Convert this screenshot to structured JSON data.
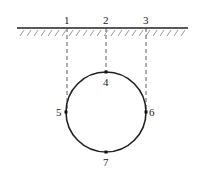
{
  "diagram": {
    "ground_surface": {
      "label": "ground surface with hatching"
    },
    "surface_points": [
      {
        "label": "1",
        "x": 67
      },
      {
        "label": "2",
        "x": 106
      },
      {
        "label": "3",
        "x": 146
      }
    ],
    "circle": {
      "cx": 106,
      "cy": 112,
      "r": 40
    },
    "circle_points": [
      {
        "label": "4",
        "position": "top"
      },
      {
        "label": "5",
        "position": "left"
      },
      {
        "label": "6",
        "position": "right"
      },
      {
        "label": "7",
        "position": "bottom"
      }
    ],
    "colors": {
      "line": "#222222",
      "hatch": "#555555"
    }
  }
}
